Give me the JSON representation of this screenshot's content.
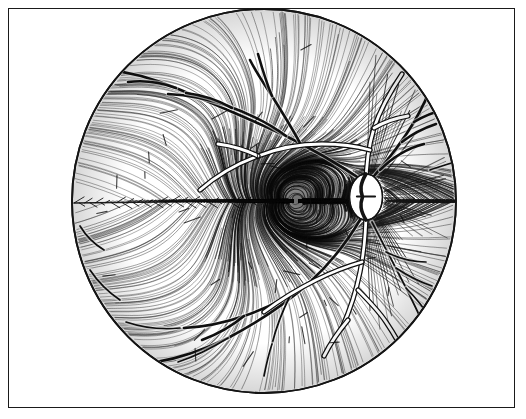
{
  "figure": {
    "title": "Retinal nerve fibre layer fundus drawing",
    "medium": "pen-and-ink line engraving",
    "caption": "",
    "background_color": "#ffffff",
    "ink_color": "#141414"
  },
  "plate": {
    "border_color": "#1a1a1a",
    "border_width_px": 1.6,
    "x": 8,
    "y": 8,
    "width": 507,
    "height": 400
  },
  "fundus": {
    "center_x": 264,
    "center_y": 201,
    "radius": 192,
    "rim_color": "#141414",
    "rim_width_px": 1.8,
    "fill_color": "#ffffff"
  },
  "optic_disc": {
    "label": "optic disc",
    "center_x": 366,
    "center_y": 197,
    "radius_x": 14,
    "radius_y": 21,
    "fill_color": "#ffffff",
    "outline_color": "#141414"
  },
  "macula": {
    "label": "macula",
    "center_x": 296,
    "center_y": 201,
    "radius_x": 62,
    "radius_y": 44,
    "shade": "dense cross-hatch"
  },
  "fovea": {
    "label": "fovea",
    "center_x": 300,
    "center_y": 201
  },
  "raphe": {
    "label": "temporal horizontal raphe",
    "x1": 74,
    "y1": 203,
    "x2": 250,
    "y2": 201
  },
  "nerve_fibre_layer": {
    "label": "arcuate nerve fibre bundles",
    "stroke_color": "#1a1a1a",
    "bundle_count": 230,
    "description": "striations sweeping arcuately from the optic disc around the macula toward the temporal periphery"
  },
  "vessels": {
    "veins": {
      "label": "retinal veins",
      "color": "#101010",
      "width_px": 2.6
    },
    "arteries": {
      "label": "retinal arteries",
      "color": "#ffffff",
      "outline_color": "#101010",
      "width_px": 3.4
    },
    "trunk": {
      "label": "central retinal vessel trunk",
      "origin_x": 366,
      "origin_y": 197
    }
  },
  "chart_data": {
    "type": "scatter",
    "title": "Retinal nerve fibre layer fundus drawing",
    "xlabel": "",
    "ylabel": "",
    "xlim": [
      72,
      456
    ],
    "ylim": [
      9,
      393
    ],
    "grid": false,
    "legend": "none",
    "annotations": [
      "optic disc",
      "macula",
      "fovea",
      "temporal horizontal raphe",
      "arcuate nerve fibre bundles",
      "retinal arteries",
      "retinal veins"
    ],
    "series": [
      {
        "name": "optic disc",
        "x": [
          366
        ],
        "y": [
          197
        ]
      },
      {
        "name": "fovea",
        "x": [
          300
        ],
        "y": [
          201
        ]
      },
      {
        "name": "fundus rim",
        "x": [
          264
        ],
        "y": [
          201
        ]
      }
    ]
  }
}
